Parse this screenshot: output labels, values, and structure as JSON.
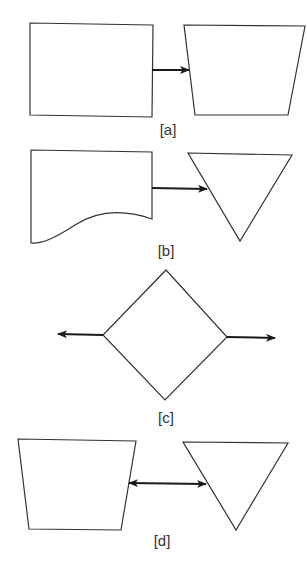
{
  "figure": {
    "panels": [
      {
        "id": "a",
        "label": "[a]",
        "left_shape": "rectangle",
        "right_shape": "trapezoid",
        "connector": "single-arrow-right"
      },
      {
        "id": "b",
        "label": "[b]",
        "left_shape": "document",
        "right_shape": "inverted-triangle",
        "connector": "single-arrow-right"
      },
      {
        "id": "c",
        "label": "[c]",
        "left_shape": "diamond",
        "right_shape": "",
        "connector": "arrows-out-left-and-right"
      },
      {
        "id": "d",
        "label": "[d]",
        "left_shape": "trapezoid",
        "right_shape": "inverted-triangle",
        "connector": "double-arrow"
      }
    ],
    "colors": {
      "stroke": "#333333",
      "arrow": "#1a1a1a",
      "background": "#ffffff"
    }
  }
}
